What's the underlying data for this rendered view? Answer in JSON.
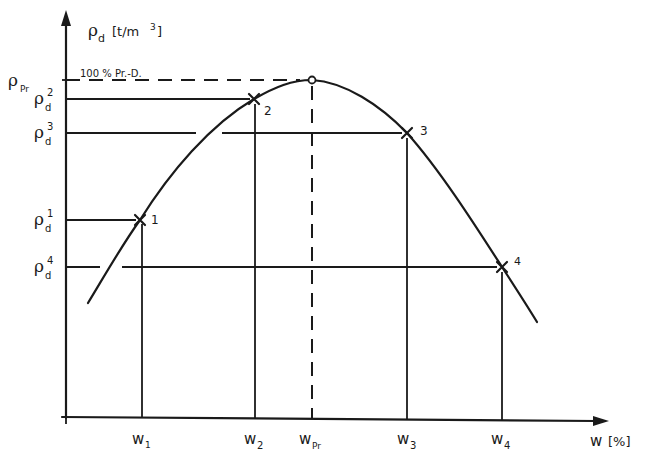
{
  "diagram": {
    "y_axis": {
      "symbol": "ρ",
      "subscript": "d",
      "unit": "[t/m³]",
      "unit_text": "[t/m",
      "unit_sup": "3",
      "unit_close": "]"
    },
    "x_axis": {
      "symbol": "w",
      "unit": "[%]"
    },
    "reference_label": "100 % Pr.-D.",
    "y_ticks": [
      {
        "id": "rho_pr",
        "main": "ρ",
        "sub": "Pr",
        "sup": ""
      },
      {
        "id": "rho_d2",
        "main": "ρ",
        "sub": "d",
        "sup": "2"
      },
      {
        "id": "rho_d3",
        "main": "ρ",
        "sub": "d",
        "sup": "3"
      },
      {
        "id": "rho_d1",
        "main": "ρ",
        "sub": "d",
        "sup": "1"
      },
      {
        "id": "rho_d4",
        "main": "ρ",
        "sub": "d",
        "sup": "4"
      }
    ],
    "x_ticks": [
      {
        "id": "w1",
        "main": "w",
        "sub": "1"
      },
      {
        "id": "w2",
        "main": "w",
        "sub": "2"
      },
      {
        "id": "wpr",
        "main": "w",
        "sub": "Pr"
      },
      {
        "id": "w3",
        "main": "w",
        "sub": "3"
      },
      {
        "id": "w4",
        "main": "w",
        "sub": "4"
      }
    ],
    "points": [
      {
        "label": "1",
        "marker": "cross"
      },
      {
        "label": "2",
        "marker": "cross"
      },
      {
        "label": "3",
        "marker": "cross"
      },
      {
        "label": "4",
        "marker": "cross"
      },
      {
        "label": "",
        "marker": "open-circle",
        "note": "Proctor optimum"
      }
    ]
  }
}
